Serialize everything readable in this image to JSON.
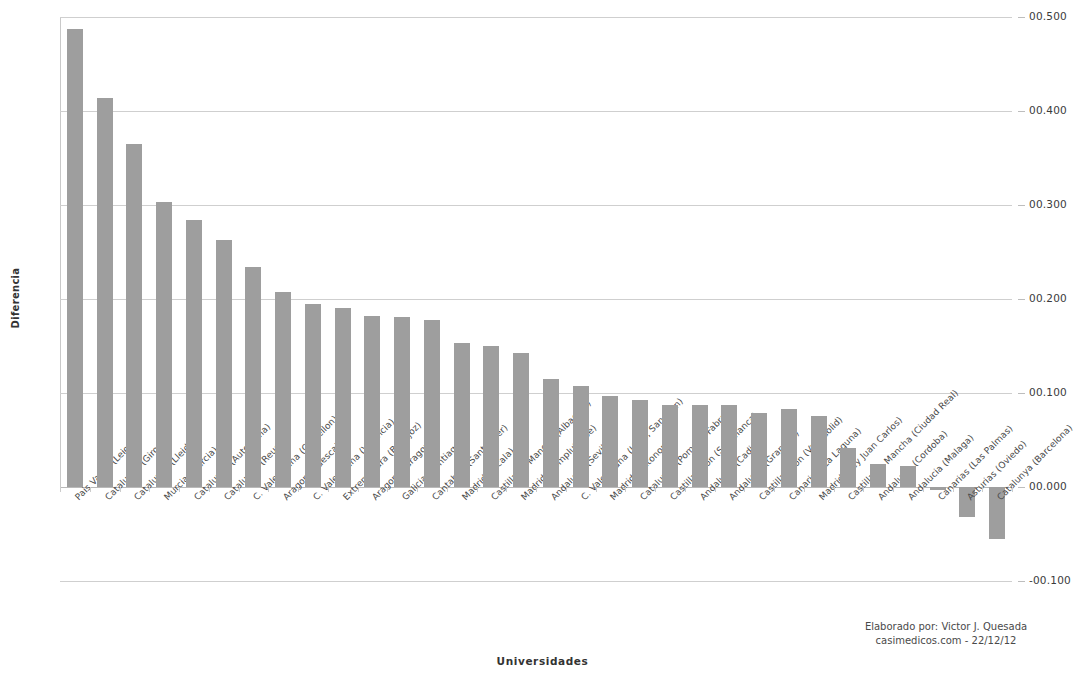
{
  "chart_data": {
    "type": "bar",
    "title": "",
    "xlabel": "Universidades",
    "ylabel": "Diferencia",
    "ylim": [
      -0.1,
      0.5
    ],
    "grid": true,
    "legend": null,
    "bar_color": "#9e9e9e",
    "y_tick_labels": [
      "00.500",
      "00.400",
      "00.300",
      "00.200",
      "00.100",
      "00.000",
      "-00.100"
    ],
    "y_tick_values": [
      0.5,
      0.4,
      0.3,
      0.2,
      0.1,
      0.0,
      -0.1
    ],
    "categories": [
      "Pais Vasco (Leioa)",
      "Catalunya (Girona)",
      "Catalunya (Lleida)",
      "Murcia (Murcia)",
      "Catalunya (Autonoma)",
      "Catalunya (Reus)",
      "C. Valenciana (Castellon)",
      "Aragon (Huesca)",
      "C. Valenciana (Valencia)",
      "Extremadura (Badajoz)",
      "Aragon (Zaragoza)",
      "Galicia (Santiago)",
      "Cantabria (Santander)",
      "Madrid (Alcala)",
      "Castilla-La Mancha (Albacete)",
      "Madrid (Complutense)",
      "Andalucia (Sevilla)",
      "C. Valenciana (UMH, San Juan)",
      "Madrid (Autonoma)",
      "Catalunya (Pompeu Fabra)",
      "Castilla-Leon (Salamanca)",
      "Andalucia (Cadiz)",
      "Andalucia (Granada)",
      "Castilla-Leon (Valladolid)",
      "Canarias (La Laguna)",
      "Madrid (Rey Juan Carlos)",
      "Castilla-La Mancha (Ciudad Real)",
      "Andalucia (Cordoba)",
      "Andalucia (Malaga)",
      "Canarias (Las Palmas)",
      "Asturias (Oviedo)",
      "Catalunya (Barcelona)"
    ],
    "values": [
      0.487,
      0.414,
      0.365,
      0.303,
      0.284,
      0.263,
      0.234,
      0.207,
      0.195,
      0.19,
      0.182,
      0.181,
      0.178,
      0.153,
      0.15,
      0.143,
      0.115,
      0.107,
      0.097,
      0.093,
      0.087,
      0.087,
      0.087,
      0.079,
      0.083,
      0.076,
      0.042,
      0.025,
      0.022,
      -0.003,
      -0.032,
      -0.055
    ]
  },
  "credit": {
    "line1": "Elaborado por: Victor J. Quesada",
    "line2": "casimedicos.com - 22/12/12"
  }
}
